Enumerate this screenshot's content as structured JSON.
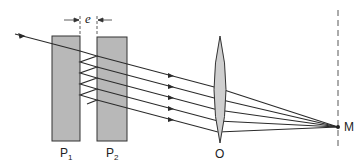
{
  "diagram": {
    "type": "optics",
    "plates": [
      {
        "id": "P1",
        "label": "P",
        "sub": "1"
      },
      {
        "id": "P2",
        "label": "P",
        "sub": "2"
      }
    ],
    "gap_label": "e",
    "lens_label": "O",
    "focus_label": "M",
    "colors": {
      "plate_fill": "#b8b8b8",
      "line": "#2a2a2a",
      "lens_fill": "#cfcfcf"
    }
  }
}
